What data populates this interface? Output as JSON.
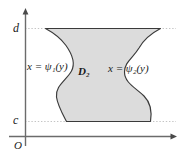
{
  "figure": {
    "type": "math-diagram",
    "background_color": "#ffffff",
    "region_fill_color": "#dcdcdc",
    "region_stroke_color": "#3a3a3a",
    "axis_color": "#6b6b6b",
    "guide_line_color": "#bdbdbd",
    "text_color": "#1a1a1a",
    "axes": {
      "y_axis_label": "",
      "x_axis_label": "",
      "origin_label": "O",
      "y_ticks": [
        {
          "name": "upper-bound",
          "label": "d",
          "symbol": "d"
        },
        {
          "name": "lower-bound",
          "label": "c",
          "symbol": "c"
        }
      ],
      "y_arrow": "up-arrowhead",
      "x_arrow": "right-arrowhead"
    },
    "labels": {
      "left_curve": {
        "prefix": "x = ",
        "fn": "ψ",
        "sub": "1",
        "arg": "(y)"
      },
      "right_curve": {
        "prefix": "x = ",
        "fn": "ψ",
        "sub": "2",
        "arg": "(y)"
      },
      "region": {
        "base": "D",
        "sub": "2"
      }
    },
    "left_curve_label_text": "x = ψ₁(y)",
    "right_curve_label_text": "x = ψ₂(y)",
    "region_label_text": "D₂",
    "guides": [
      {
        "name": "guide-line-d",
        "y_symbol": "d"
      },
      {
        "name": "guide-line-c",
        "y_symbol": "c"
      }
    ]
  }
}
